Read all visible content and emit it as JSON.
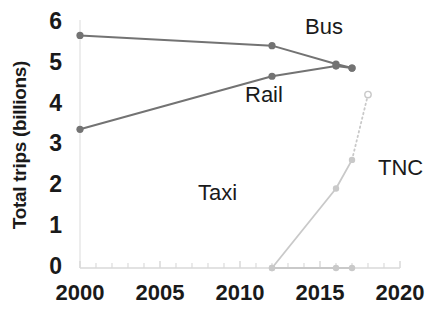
{
  "chart_data": {
    "type": "line",
    "title": "",
    "xlabel": "",
    "ylabel": "Total trips (billions)",
    "xlim": [
      1999,
      2021
    ],
    "ylim": [
      0,
      6
    ],
    "xticks": [
      "2000",
      "2005",
      "2010",
      "2015",
      "2020"
    ],
    "yticks": [
      "0",
      "1",
      "2",
      "3",
      "4",
      "5",
      "6"
    ],
    "grid": false,
    "legend": "inline-annotations",
    "series": [
      {
        "name": "Bus",
        "color": "#737373",
        "style": "solid",
        "x": [
          2000,
          2012,
          2016,
          2017
        ],
        "values": [
          5.7,
          5.45,
          5.0,
          4.9
        ]
      },
      {
        "name": "Rail",
        "color": "#737373",
        "style": "solid",
        "x": [
          2000,
          2012,
          2016,
          2017
        ],
        "values": [
          3.4,
          4.7,
          4.95,
          4.9
        ]
      },
      {
        "name": "Taxi",
        "color": "#c9c9c9",
        "style": "solid",
        "x": [
          2012,
          2016,
          2017
        ],
        "values": [
          0.0,
          0.0,
          0.0
        ]
      },
      {
        "name": "TNC",
        "color": "#c9c9c9",
        "style": "solid-then-dotted",
        "x": [
          2012,
          2016,
          2017,
          2018
        ],
        "values": [
          0.0,
          1.95,
          2.65,
          4.25
        ],
        "open_marker_index": 3
      }
    ],
    "annotations": [
      {
        "text": "Bus",
        "x": 2016.0,
        "y": 5.75
      },
      {
        "text": "Rail",
        "x": 2012.6,
        "y": 4.15
      },
      {
        "text": "Taxi",
        "x": 2010.2,
        "y": 1.65
      },
      {
        "text": "TNC",
        "x": 2017.6,
        "y": 2.35
      }
    ]
  },
  "axis": {
    "ylabel": "Total trips (billions)",
    "ytick_0": "0",
    "ytick_1": "1",
    "ytick_2": "2",
    "ytick_3": "3",
    "ytick_4": "4",
    "ytick_5": "5",
    "ytick_6": "6",
    "xtick_0": "2000",
    "xtick_1": "2005",
    "xtick_2": "2010",
    "xtick_3": "2015",
    "xtick_4": "2020"
  },
  "labels": {
    "bus": "Bus",
    "rail": "Rail",
    "taxi": "Taxi",
    "tnc": "TNC"
  },
  "colors": {
    "dark_series": "#737373",
    "light_series": "#c9c9c9",
    "axis": "#d8d8d8",
    "text": "#1a1a1a"
  }
}
